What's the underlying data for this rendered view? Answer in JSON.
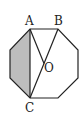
{
  "diagram": {
    "type": "geometry",
    "shape": "regular octagon",
    "labels": {
      "a": "A",
      "b": "B",
      "c": "C",
      "o": "O"
    },
    "colors": {
      "stroke": "#222222",
      "shade": "#bdbdbd",
      "background": "#ffffff"
    }
  }
}
